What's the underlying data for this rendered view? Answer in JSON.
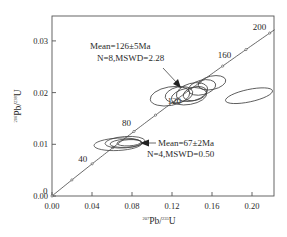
{
  "chart_data": {
    "type": "scatter",
    "subtype": "U-Pb concordia diagram with error ellipses",
    "title": "",
    "xlabel": "207Pb/235U",
    "ylabel": "206Pb/238U",
    "xlabel_parts": {
      "sup": "207",
      "base1": "Pb/",
      "sup2": "235",
      "base2": "U"
    },
    "ylabel_parts": {
      "sup": "206",
      "base1": "Pb/",
      "sup2": "238",
      "base2": "U"
    },
    "xlim": [
      0.0,
      0.222
    ],
    "ylim": [
      0.0,
      0.035
    ],
    "x_ticks": [
      "0.00",
      "0.04",
      "0.08",
      "0.12",
      "0.16",
      "0.20"
    ],
    "x_tick_values": [
      0.0,
      0.04,
      0.08,
      0.12,
      0.16,
      0.2
    ],
    "y_ticks": [
      "0.00",
      "0.01",
      "0.02",
      "0.03"
    ],
    "y_tick_values": [
      0.0,
      0.01,
      0.02,
      0.03
    ],
    "grid": false,
    "legend": null,
    "concordia": {
      "age_labels": [
        {
          "age": "0",
          "x": 0.0,
          "y": 0.0
        },
        {
          "age": "40",
          "x": 0.04,
          "y": 0.0062
        },
        {
          "age": "80",
          "x": 0.082,
          "y": 0.0125
        },
        {
          "age": "120",
          "x": 0.125,
          "y": 0.0188
        },
        {
          "age": "160",
          "x": 0.17,
          "y": 0.0251
        },
        {
          "age": "200",
          "x": 0.217,
          "y": 0.0315
        }
      ],
      "tick_marks_x": [
        0.0,
        0.02,
        0.04,
        0.061,
        0.082,
        0.103,
        0.125,
        0.147,
        0.17,
        0.193,
        0.217
      ]
    },
    "series": [
      {
        "name": "Group 1 (young)",
        "mean_age": "67±2Ma",
        "n": 4,
        "mswd": 0.5,
        "ellipses": [
          {
            "cx": 0.066,
            "cy": 0.01,
            "rx": 0.024,
            "ry": 0.0012,
            "angle": -3
          },
          {
            "cx": 0.073,
            "cy": 0.0104,
            "rx": 0.02,
            "ry": 0.0011,
            "angle": -4
          },
          {
            "cx": 0.074,
            "cy": 0.0102,
            "rx": 0.016,
            "ry": 0.0008,
            "angle": -3
          },
          {
            "cx": 0.077,
            "cy": 0.0103,
            "rx": 0.012,
            "ry": 0.0006,
            "angle": -3
          }
        ]
      },
      {
        "name": "Group 2 (old)",
        "mean_age": "126±5Ma",
        "n": 8,
        "mswd": 2.28,
        "ellipses": [
          {
            "cx": 0.118,
            "cy": 0.0193,
            "rx": 0.02,
            "ry": 0.0018,
            "angle": -10
          },
          {
            "cx": 0.127,
            "cy": 0.0196,
            "rx": 0.014,
            "ry": 0.0015,
            "angle": -12
          },
          {
            "cx": 0.137,
            "cy": 0.0193,
            "rx": 0.018,
            "ry": 0.0016,
            "angle": -10
          },
          {
            "cx": 0.14,
            "cy": 0.0201,
            "rx": 0.016,
            "ry": 0.0017,
            "angle": -15
          },
          {
            "cx": 0.143,
            "cy": 0.0198,
            "rx": 0.012,
            "ry": 0.0013,
            "angle": -14
          },
          {
            "cx": 0.15,
            "cy": 0.021,
            "rx": 0.014,
            "ry": 0.0014,
            "angle": -14
          },
          {
            "cx": 0.16,
            "cy": 0.0219,
            "rx": 0.014,
            "ry": 0.0013,
            "angle": -12
          },
          {
            "cx": 0.197,
            "cy": 0.0194,
            "rx": 0.024,
            "ry": 0.0012,
            "angle": -12
          }
        ]
      }
    ],
    "annotations": [
      {
        "line1": "Mean=126±5Ma",
        "line2": "N=8,MSWD=2.28",
        "arrow_target_x": 0.128,
        "arrow_target_y": 0.0208
      },
      {
        "line1": "Mean=67±2Ma",
        "line2": "N=4,MSWD=0.50",
        "arrow_target_x": 0.086,
        "arrow_target_y": 0.0101
      }
    ]
  },
  "labels": {
    "x_axis": "207Pb/235U",
    "y_axis": "206Pb/238U",
    "annotation_old_line1": "Mean=126±5Ma",
    "annotation_old_line2": "N=8,MSWD=2.28",
    "annotation_young_line1": "Mean=67±2Ma",
    "annotation_young_line2": "N=4,MSWD=0.50"
  },
  "colors": {
    "axis": "#555555",
    "line": "#444444",
    "text": "#2a2a2a",
    "background": "#ffffff"
  }
}
